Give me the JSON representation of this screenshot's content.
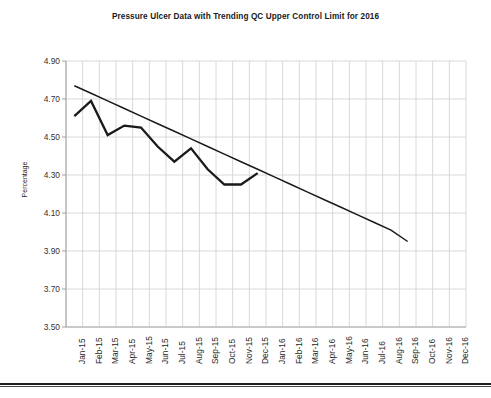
{
  "chart_data": {
    "type": "line",
    "title": "Pressure Ulcer Data with Trending QC Upper Control Limit for 2016",
    "xlabel": "",
    "ylabel": "Percentage",
    "ylim": [
      3.5,
      4.9
    ],
    "yticks": [
      "3.50",
      "3.70",
      "3.90",
      "4.10",
      "4.30",
      "4.50",
      "4.70",
      "4.90"
    ],
    "ytick_values": [
      3.5,
      3.7,
      3.9,
      4.1,
      4.3,
      4.5,
      4.7,
      4.9
    ],
    "grid": true,
    "legend": "none",
    "categories": [
      "Jan-15",
      "Feb-15",
      "Mar-15",
      "Apr-15",
      "May-15",
      "Jun-15",
      "Jul-15",
      "Aug-15",
      "Sep-15",
      "Oct-15",
      "Nov-15",
      "Dec-15",
      "Jan-16",
      "Feb-16",
      "Mar-16",
      "Apr-16",
      "May-16",
      "Jun-16",
      "Jul-16",
      "Aug-16",
      "Sep-16",
      "Oct-16",
      "Nov-16",
      "Dec-16"
    ],
    "series": [
      {
        "name": "Pressure Ulcer Data",
        "color": "#1a1a1a",
        "values": [
          4.61,
          4.69,
          4.51,
          4.56,
          4.55,
          4.45,
          4.37,
          4.44,
          4.33,
          4.25,
          4.25,
          4.31,
          null,
          null,
          null,
          null,
          null,
          null,
          null,
          null,
          null,
          null,
          null,
          null
        ]
      },
      {
        "name": "Trending QC Upper Control Limit",
        "color": "#1a1a1a",
        "values": [
          4.77,
          4.73,
          4.69,
          4.65,
          4.61,
          4.57,
          4.53,
          4.49,
          4.45,
          4.41,
          4.37,
          4.33,
          4.29,
          4.25,
          4.21,
          4.17,
          4.13,
          4.09,
          4.05,
          4.01,
          3.95,
          null,
          null,
          null
        ]
      }
    ]
  }
}
